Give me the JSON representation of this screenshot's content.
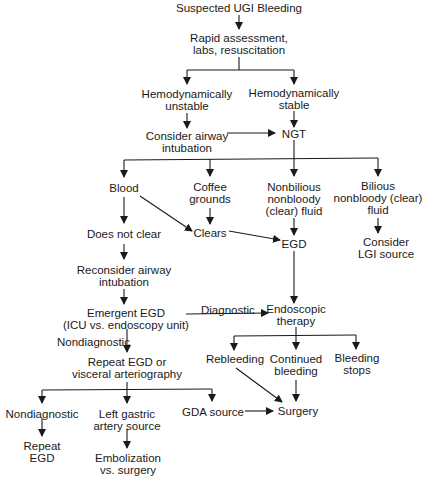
{
  "diagram": {
    "title": "Suspected UGI Bleeding",
    "nodes": {
      "start": [
        "Suspected UGI Bleeding"
      ],
      "rapid": [
        "Rapid assessment,",
        "labs, resuscitation"
      ],
      "unstable": [
        "Hemodynamically",
        "unstable"
      ],
      "stable": [
        "Hemodynamically",
        "stable"
      ],
      "airway": [
        "Consider airway",
        "intubation"
      ],
      "ngt": [
        "NGT"
      ],
      "blood": [
        "Blood"
      ],
      "coffee": [
        "Coffee",
        "grounds"
      ],
      "nonbilious": [
        "Nonbilious",
        "nonbloody",
        "(clear) fluid"
      ],
      "bilious": [
        "Bilious",
        "nonbloody (clear)",
        "fluid"
      ],
      "notclear": [
        "Does not clear"
      ],
      "clears": [
        "Clears"
      ],
      "egd": [
        "EGD"
      ],
      "lgi": [
        "Consider",
        "LGI source"
      ],
      "reconsider": [
        "Reconsider airway",
        "intubation"
      ],
      "emergent": [
        "Emergent EGD",
        "(ICU vs. endoscopy unit)"
      ],
      "endo": [
        "Endoscopic",
        "therapy"
      ],
      "repeat": [
        "Repeat EGD or",
        "visceral arteriography"
      ],
      "rebleeding": [
        "Rebleeding"
      ],
      "continued": [
        "Continued",
        "bleeding"
      ],
      "stops": [
        "Bleeding",
        "stops"
      ],
      "nondiag2": [
        "Nondiagnostic"
      ],
      "leftgastric": [
        "Left gastric",
        "artery source"
      ],
      "gda": [
        "GDA source"
      ],
      "surgery": [
        "Surgery"
      ],
      "repeategd": [
        "Repeat",
        "EGD"
      ],
      "embol": [
        "Embolization",
        "vs. surgery"
      ]
    },
    "edge_labels": {
      "diagnostic": "Diagnostic",
      "nondiagnostic": "Nondiagnostic"
    }
  }
}
